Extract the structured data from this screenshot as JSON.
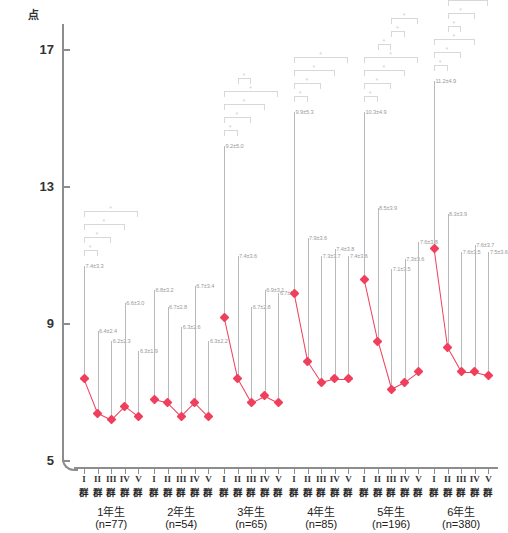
{
  "axes": {
    "y_unit_label": "点",
    "y_ticks": [
      {
        "value": 17,
        "label": "17"
      },
      {
        "value": 13,
        "label": "13"
      },
      {
        "value": 9,
        "label": "9"
      },
      {
        "value": 5,
        "label": "5"
      }
    ],
    "significance_marker": "*"
  },
  "chart_data": {
    "type": "line",
    "title": "",
    "xlabel": "",
    "ylabel": "点",
    "ylim": [
      5,
      17
    ],
    "grid": false,
    "legend": "none",
    "accent_color": "#ef3f5c",
    "errorbar_color": "#b9b9b9",
    "annotation_color": "#cfcfcf",
    "errorbar_direction": "upper-only",
    "subgroup_labels": [
      "I群",
      "II群",
      "III群",
      "IV群",
      "V群"
    ],
    "groups": [
      {
        "grade": "1年生",
        "n_label": "(n=77)",
        "points": [
          {
            "subgroup": "I群",
            "roman": "I",
            "gun": "群",
            "mean": 7.4,
            "sd": 3.3,
            "label": "7.4±3.3"
          },
          {
            "subgroup": "II群",
            "roman": "II",
            "gun": "群",
            "mean": 6.4,
            "sd": 2.4,
            "label": "6.4±2.4"
          },
          {
            "subgroup": "III群",
            "roman": "III",
            "gun": "群",
            "mean": 6.2,
            "sd": 2.3,
            "label": "6.2±2.3"
          },
          {
            "subgroup": "IV群",
            "roman": "IV",
            "gun": "群",
            "mean": 6.6,
            "sd": 3.0,
            "label": "6.6±3.0"
          },
          {
            "subgroup": "V群",
            "roman": "V",
            "gun": "群",
            "mean": 6.3,
            "sd": 1.9,
            "label": "6.3±1.9"
          }
        ],
        "brackets": [
          {
            "from": 0,
            "to": 1,
            "star": "*"
          },
          {
            "from": 0,
            "to": 2,
            "star": "*"
          },
          {
            "from": 0,
            "to": 3,
            "star": "*"
          },
          {
            "from": 0,
            "to": 4,
            "star": "*"
          }
        ]
      },
      {
        "grade": "2年生",
        "n_label": "(n=54)",
        "points": [
          {
            "subgroup": "I群",
            "roman": "I",
            "gun": "群",
            "mean": 6.8,
            "sd": 3.2,
            "label": "6.8±3.2"
          },
          {
            "subgroup": "II群",
            "roman": "II",
            "gun": "群",
            "mean": 6.7,
            "sd": 2.8,
            "label": "6.7±2.8"
          },
          {
            "subgroup": "III群",
            "roman": "III",
            "gun": "群",
            "mean": 6.3,
            "sd": 2.6,
            "label": "6.3±2.6"
          },
          {
            "subgroup": "IV群",
            "roman": "IV",
            "gun": "群",
            "mean": 6.7,
            "sd": 3.4,
            "label": "6.7±3.4"
          },
          {
            "subgroup": "V群",
            "roman": "V",
            "gun": "群",
            "mean": 6.3,
            "sd": 2.2,
            "label": "6.3±2.2"
          }
        ],
        "brackets": []
      },
      {
        "grade": "3年生",
        "n_label": "(n=65)",
        "points": [
          {
            "subgroup": "I群",
            "roman": "I",
            "gun": "群",
            "mean": 9.2,
            "sd": 5.0,
            "label": "9.2±5.0"
          },
          {
            "subgroup": "II群",
            "roman": "II",
            "gun": "群",
            "mean": 7.4,
            "sd": 3.6,
            "label": "7.4±3.6"
          },
          {
            "subgroup": "III群",
            "roman": "III",
            "gun": "群",
            "mean": 6.7,
            "sd": 2.8,
            "label": "6.7±2.8"
          },
          {
            "subgroup": "IV群",
            "roman": "IV",
            "gun": "群",
            "mean": 6.9,
            "sd": 3.1,
            "label": "6.9±3.1"
          },
          {
            "subgroup": "V群",
            "roman": "V",
            "gun": "群",
            "mean": 6.7,
            "sd": 3.2,
            "label": "6.7±3.2"
          }
        ],
        "brackets": [
          {
            "from": 0,
            "to": 1,
            "star": "*"
          },
          {
            "from": 0,
            "to": 2,
            "star": "*"
          },
          {
            "from": 0,
            "to": 3,
            "star": "*"
          },
          {
            "from": 0,
            "to": 4,
            "star": "*"
          },
          {
            "from": 1,
            "to": 2,
            "star": "*"
          }
        ]
      },
      {
        "grade": "4年生",
        "n_label": "(n=85)",
        "points": [
          {
            "subgroup": "I群",
            "roman": "I",
            "gun": "群",
            "mean": 9.9,
            "sd": 5.3,
            "label": "9.9±5.3"
          },
          {
            "subgroup": "II群",
            "roman": "II",
            "gun": "群",
            "mean": 7.9,
            "sd": 3.6,
            "label": "7.9±3.6"
          },
          {
            "subgroup": "III群",
            "roman": "III",
            "gun": "群",
            "mean": 7.3,
            "sd": 3.7,
            "label": "7.3±3.7"
          },
          {
            "subgroup": "IV群",
            "roman": "IV",
            "gun": "群",
            "mean": 7.4,
            "sd": 3.8,
            "label": "7.4±3.8"
          },
          {
            "subgroup": "V群",
            "roman": "V",
            "gun": "群",
            "mean": 7.4,
            "sd": 3.6,
            "label": "7.4±3.6"
          }
        ],
        "brackets": [
          {
            "from": 0,
            "to": 1,
            "star": "*"
          },
          {
            "from": 0,
            "to": 2,
            "star": "*"
          },
          {
            "from": 0,
            "to": 3,
            "star": "*"
          },
          {
            "from": 0,
            "to": 4,
            "star": "*"
          }
        ]
      },
      {
        "grade": "5年生",
        "n_label": "(n=196)",
        "points": [
          {
            "subgroup": "I群",
            "roman": "I",
            "gun": "群",
            "mean": 10.3,
            "sd": 4.9,
            "label": "10.3±4.9"
          },
          {
            "subgroup": "II群",
            "roman": "II",
            "gun": "群",
            "mean": 8.5,
            "sd": 3.9,
            "label": "8.5±3.9"
          },
          {
            "subgroup": "III群",
            "roman": "III",
            "gun": "群",
            "mean": 7.1,
            "sd": 3.5,
            "label": "7.1±3.5"
          },
          {
            "subgroup": "IV群",
            "roman": "IV",
            "gun": "群",
            "mean": 7.3,
            "sd": 3.6,
            "label": "7.3±3.6"
          },
          {
            "subgroup": "V群",
            "roman": "V",
            "gun": "群",
            "mean": 7.6,
            "sd": 3.8,
            "label": "7.6±3.8"
          }
        ],
        "brackets": [
          {
            "from": 0,
            "to": 1,
            "star": "*"
          },
          {
            "from": 0,
            "to": 2,
            "star": "*"
          },
          {
            "from": 0,
            "to": 3,
            "star": "*"
          },
          {
            "from": 0,
            "to": 4,
            "star": "*"
          },
          {
            "from": 1,
            "to": 2,
            "star": "*"
          },
          {
            "from": 2,
            "to": 3,
            "star": "*"
          },
          {
            "from": 2,
            "to": 4,
            "star": "*"
          }
        ]
      },
      {
        "grade": "6年生",
        "n_label": "(n=380)",
        "points": [
          {
            "subgroup": "I群",
            "roman": "I",
            "gun": "群",
            "mean": 11.2,
            "sd": 4.9,
            "label": "11.2±4.9"
          },
          {
            "subgroup": "II群",
            "roman": "II",
            "gun": "群",
            "mean": 8.3,
            "sd": 3.9,
            "label": "8.3±3.9"
          },
          {
            "subgroup": "III群",
            "roman": "III",
            "gun": "群",
            "mean": 7.6,
            "sd": 3.5,
            "label": "7.6±3.5"
          },
          {
            "subgroup": "IV群",
            "roman": "IV",
            "gun": "群",
            "mean": 7.6,
            "sd": 3.7,
            "label": "7.6±3.7"
          },
          {
            "subgroup": "V群",
            "roman": "V",
            "gun": "群",
            "mean": 7.5,
            "sd": 3.6,
            "label": "7.5±3.6"
          }
        ],
        "brackets": [
          {
            "from": 0,
            "to": 1,
            "star": "*"
          },
          {
            "from": 0,
            "to": 2,
            "star": "*"
          },
          {
            "from": 0,
            "to": 3,
            "star": "*"
          },
          {
            "from": 1,
            "to": 2,
            "star": "*"
          },
          {
            "from": 1,
            "to": 3,
            "star": "*"
          },
          {
            "from": 1,
            "to": 4,
            "star": "*"
          },
          {
            "from": 2,
            "to": 3,
            "star": "*"
          }
        ]
      }
    ]
  }
}
